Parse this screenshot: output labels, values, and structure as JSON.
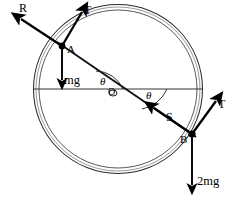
{
  "figure": {
    "type": "physics-free-body-diagram",
    "background_color": "#ffffff",
    "stroke_color": "#000000",
    "width": 235,
    "height": 207
  },
  "geometry": {
    "center": {
      "x": 118,
      "y": 89,
      "label": "O"
    },
    "ring": {
      "outer_radius": 84,
      "inner_radius": 79,
      "description": "double-line circular ring"
    },
    "chord": {
      "from": "A",
      "to": "B",
      "passes_through_center": true
    },
    "horizontal_diameter": {
      "y": 89,
      "x_start": 34,
      "x_end": 202
    },
    "points": [
      {
        "id": "A",
        "label": "A",
        "x": 62,
        "y": 46
      },
      {
        "id": "B",
        "label": "B",
        "x": 191,
        "y": 133
      },
      {
        "id": "O",
        "label": "O",
        "x": 118,
        "y": 89
      }
    ]
  },
  "angles": [
    {
      "label": "θ",
      "at": "A-side",
      "between": "chord and horizontal diameter",
      "x": 103,
      "y": 79
    },
    {
      "label": "θ",
      "at": "B-side",
      "between": "chord and horizontal diameter",
      "x": 147,
      "y": 95
    }
  ],
  "forces": [
    {
      "id": "R",
      "label": "R",
      "applied_at": "A",
      "direction": "up-left",
      "description": "normal reaction at A"
    },
    {
      "id": "T_A",
      "label": "T",
      "applied_at": "A",
      "direction": "up-right, tangent to ring",
      "description": "tension at A"
    },
    {
      "id": "mg",
      "label": "mg",
      "applied_at": "A",
      "direction": "down",
      "description": "weight of bead at A"
    },
    {
      "id": "S",
      "label": "S",
      "applied_at": "B",
      "direction": "up-left along chord toward O",
      "description": "normal reaction at B"
    },
    {
      "id": "T_B",
      "label": "T",
      "applied_at": "B",
      "direction": "up-right, tangent to ring",
      "description": "tension at B"
    },
    {
      "id": "2mg",
      "label": "2mg",
      "applied_at": "B",
      "direction": "down",
      "description": "weight of bead at B"
    }
  ],
  "labels": {
    "point_a": "A",
    "point_b": "B",
    "center_o": "O",
    "force_r": "R",
    "force_t_top": "T",
    "force_t_right": "T",
    "weight_mg": "mg",
    "weight_2mg": "2mg",
    "angle_left": "θ",
    "angle_right": "θ"
  }
}
